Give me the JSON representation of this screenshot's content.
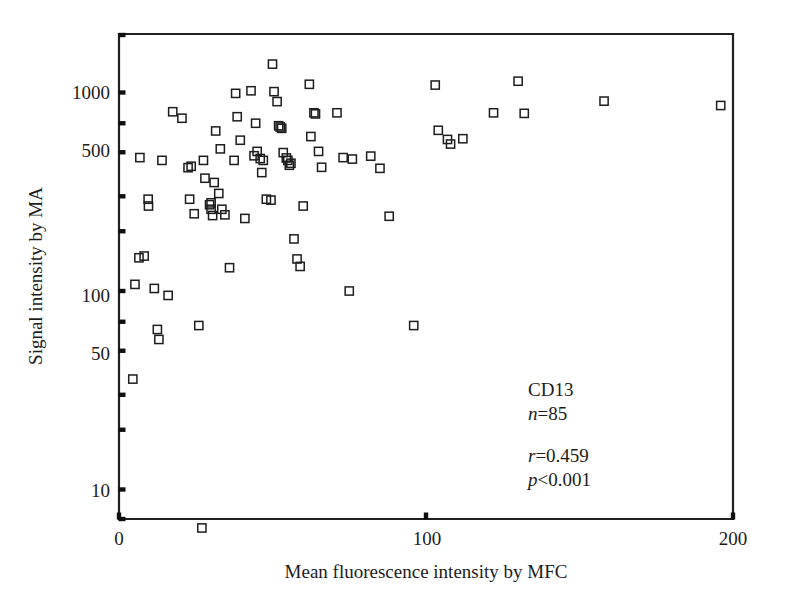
{
  "chart_data": {
    "type": "scatter",
    "title": "",
    "xlabel": "Mean fluorescence intensity by MFC",
    "ylabel": "Signal intensity by MA",
    "xlim": [
      0,
      200
    ],
    "ylim": [
      7,
      1700
    ],
    "yscale": "log",
    "xscale": "linear",
    "grid": false,
    "legend": null,
    "xticks": [
      0,
      100,
      200
    ],
    "xticklabels": [
      "0",
      "100",
      "200"
    ],
    "yticks": [
      10,
      20,
      30,
      50,
      70,
      100,
      200,
      300,
      500,
      700,
      1000
    ],
    "yticklabels_shown": [
      "10",
      "50",
      "100",
      "500",
      "1000"
    ],
    "marker": "open-square",
    "marker_color": "#1d1d1d",
    "n_points": 85,
    "series": [
      {
        "name": "CD13",
        "points": [
          [
            4.5,
            36
          ],
          [
            5.2,
            108
          ],
          [
            6.5,
            147
          ],
          [
            8.2,
            150
          ],
          [
            6.8,
            470
          ],
          [
            9.5,
            290
          ],
          [
            9.6,
            268
          ],
          [
            11.5,
            103
          ],
          [
            12.5,
            64
          ],
          [
            13.0,
            57
          ],
          [
            16.0,
            95
          ],
          [
            14.0,
            455
          ],
          [
            17.5,
            800
          ],
          [
            20.5,
            742
          ],
          [
            22.5,
            418
          ],
          [
            23.5,
            425
          ],
          [
            23.0,
            290
          ],
          [
            24.5,
            245
          ],
          [
            26.0,
            67
          ],
          [
            27.0,
            6.4
          ],
          [
            27.5,
            455
          ],
          [
            28.0,
            370
          ],
          [
            30.0,
            278
          ],
          [
            29.5,
            272
          ],
          [
            30.0,
            258
          ],
          [
            30.5,
            240
          ],
          [
            31.5,
            640
          ],
          [
            33.0,
            520
          ],
          [
            31.0,
            352
          ],
          [
            32.5,
            310
          ],
          [
            33.5,
            258
          ],
          [
            34.5,
            242
          ],
          [
            36.0,
            131
          ],
          [
            38.0,
            990
          ],
          [
            38.5,
            755
          ],
          [
            39.5,
            575
          ],
          [
            37.5,
            455
          ],
          [
            41.0,
            232
          ],
          [
            43.0,
            1020
          ],
          [
            44.5,
            700
          ],
          [
            45.0,
            505
          ],
          [
            44.0,
            480
          ],
          [
            46.0,
            465
          ],
          [
            47.0,
            455
          ],
          [
            46.5,
            395
          ],
          [
            48.0,
            290
          ],
          [
            49.5,
            287
          ],
          [
            50.0,
            1390
          ],
          [
            50.5,
            1010
          ],
          [
            51.5,
            900
          ],
          [
            52.0,
            680
          ],
          [
            52.5,
            670
          ],
          [
            53.0,
            660
          ],
          [
            53.5,
            498
          ],
          [
            54.5,
            468
          ],
          [
            55.0,
            455
          ],
          [
            56.0,
            440
          ],
          [
            55.5,
            430
          ],
          [
            57.0,
            183
          ],
          [
            58.0,
            145
          ],
          [
            59.0,
            133
          ],
          [
            62.0,
            1100
          ],
          [
            63.5,
            790
          ],
          [
            64.0,
            780
          ],
          [
            62.5,
            600
          ],
          [
            65.0,
            505
          ],
          [
            66.0,
            420
          ],
          [
            60.0,
            268
          ],
          [
            71.0,
            790
          ],
          [
            73.0,
            470
          ],
          [
            76.0,
            462
          ],
          [
            75.0,
            100
          ],
          [
            82.0,
            478
          ],
          [
            85.0,
            415
          ],
          [
            88.0,
            238
          ],
          [
            96.0,
            67
          ],
          [
            103.0,
            1090
          ],
          [
            104.0,
            645
          ],
          [
            107.0,
            580
          ],
          [
            108.0,
            550
          ],
          [
            112.0,
            585
          ],
          [
            122.0,
            790
          ],
          [
            130.0,
            1140
          ],
          [
            132.0,
            785
          ],
          [
            158.0,
            905
          ],
          [
            196.0,
            860
          ]
        ]
      }
    ],
    "annotations": [
      {
        "id": "label-marker",
        "text": "CD13"
      },
      {
        "id": "label-n",
        "text": "n=85"
      },
      {
        "id": "label-r",
        "text": "r=0.459"
      },
      {
        "id": "label-p",
        "text": "p<0.001"
      }
    ]
  },
  "annotation_text": {
    "marker_name": "CD13",
    "n_prefix": "n",
    "n_value": "=85",
    "r_prefix": "r",
    "r_value": "=0.459",
    "p_prefix": "p",
    "p_value": "<0.001"
  },
  "axes": {
    "x_title": "Mean fluorescence intensity by MFC",
    "y_title": "Signal intensity by MA",
    "x_tick_0": "0",
    "x_tick_100": "100",
    "x_tick_200": "200",
    "y_tick_10": "10",
    "y_tick_50": "50",
    "y_tick_100": "100",
    "y_tick_500": "500",
    "y_tick_1000": "1000"
  },
  "colors": {
    "ink": "#1c1c1c",
    "marker_stroke": "#1d1d1d",
    "background": "#ffffff"
  }
}
